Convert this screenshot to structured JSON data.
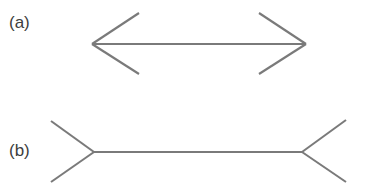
{
  "figure": {
    "background_color": "#ffffff",
    "line_color": "#7a7a7a",
    "label_color": "#3d3d3d",
    "line_width": 2.1,
    "width": 369,
    "height": 183
  },
  "panels": [
    {
      "id": "a",
      "label": "(a)",
      "description": "horizontal shaft with inward-pointing arrowheads at both ends",
      "shaft": {
        "x1": 92,
        "y1": 44,
        "x2": 306,
        "y2": 44
      },
      "fins": [
        {
          "name": "left-upper-fin",
          "x1": 92,
          "y1": 44,
          "x2": 139,
          "y2": 13
        },
        {
          "name": "left-lower-fin",
          "x1": 92,
          "y1": 44,
          "x2": 139,
          "y2": 74
        },
        {
          "name": "right-upper-fin",
          "x1": 306,
          "y1": 44,
          "x2": 259,
          "y2": 13
        },
        {
          "name": "right-lower-fin",
          "x1": 306,
          "y1": 44,
          "x2": 259,
          "y2": 74
        }
      ]
    },
    {
      "id": "b",
      "label": "(b)",
      "description": "horizontal shaft with outward-pointing fins at both ends",
      "shaft": {
        "x1": 94,
        "y1": 152,
        "x2": 302,
        "y2": 152
      },
      "fins": [
        {
          "name": "left-upper-fin",
          "x1": 94,
          "y1": 152,
          "x2": 51,
          "y2": 121
        },
        {
          "name": "left-lower-fin",
          "x1": 94,
          "y1": 152,
          "x2": 51,
          "y2": 182
        },
        {
          "name": "right-upper-fin",
          "x1": 302,
          "y1": 152,
          "x2": 346,
          "y2": 120
        },
        {
          "name": "right-lower-fin",
          "x1": 302,
          "y1": 152,
          "x2": 346,
          "y2": 182
        }
      ]
    }
  ]
}
